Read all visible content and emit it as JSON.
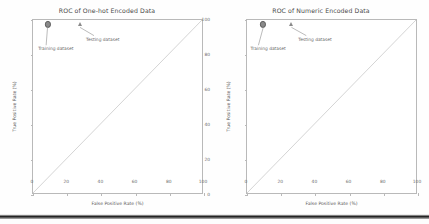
{
  "figure": {
    "background": "#ffffff",
    "axis_color": "#b9b9b9",
    "diagonal_color": "#c9c9c9",
    "marker_color": "#8a8a8a",
    "text_color": "#6d6d6d"
  },
  "chart_data": [
    {
      "type": "scatter",
      "title": "ROC of One-hot Encoded Data",
      "xlabel": "False Positive Rate (%)",
      "ylabel": "True Positive Rate (%)",
      "xlim": [
        0,
        100
      ],
      "ylim": [
        0,
        100
      ],
      "xticks": [
        0,
        20,
        40,
        60,
        80,
        100
      ],
      "yticks": [
        0,
        20,
        40,
        60,
        80,
        100
      ],
      "xticklabels": [
        "0",
        "20",
        "40",
        "60",
        "80",
        "100"
      ],
      "yticklabels": [
        "0",
        "20",
        "40",
        "60",
        "80",
        "100"
      ],
      "grid": false,
      "legend": "none",
      "reference_line": {
        "name": "chance-diagonal",
        "from": [
          0,
          0
        ],
        "to": [
          100,
          100
        ]
      },
      "series": [
        {
          "name": "Training dataset",
          "marker": "circle",
          "points": [
            {
              "x": 8.5,
              "y": 97.5
            }
          ]
        },
        {
          "name": "Testing dataset",
          "marker": "triangle",
          "points": [
            {
              "x": 27.5,
              "y": 97.5
            }
          ]
        }
      ],
      "annotations": [
        {
          "text": "Training dataset",
          "target": [
            8.5,
            97.5
          ],
          "label_at": [
            3.0,
            85.0
          ]
        },
        {
          "text": "Testing dataset",
          "target": [
            27.5,
            97.5
          ],
          "label_at": [
            31.0,
            90.5
          ]
        }
      ]
    },
    {
      "type": "scatter",
      "title": "ROC of Numeric Encoded Data",
      "xlabel": "False Positive Rate (%)",
      "ylabel": "True Positive Rate (%)",
      "xlim": [
        0,
        100
      ],
      "ylim": [
        0,
        100
      ],
      "xticks": [
        0,
        20,
        40,
        60,
        80,
        100
      ],
      "yticks": [
        0,
        20,
        40,
        60,
        80,
        100
      ],
      "xticklabels": [
        "0",
        "20",
        "40",
        "60",
        "80",
        "100"
      ],
      "yticklabels": [
        "0",
        "20",
        "40",
        "60",
        "80",
        "100"
      ],
      "grid": false,
      "legend": "none",
      "reference_line": {
        "name": "chance-diagonal",
        "from": [
          0,
          0
        ],
        "to": [
          100,
          100
        ]
      },
      "series": [
        {
          "name": "Training dataset",
          "marker": "circle",
          "points": [
            {
              "x": 9.5,
              "y": 97.5
            }
          ]
        },
        {
          "name": "Testing dataset",
          "marker": "triangle",
          "points": [
            {
              "x": 26.0,
              "y": 97.5
            }
          ]
        }
      ],
      "annotations": [
        {
          "text": "Training dataset",
          "target": [
            9.5,
            97.5
          ],
          "label_at": [
            2.0,
            85.0
          ]
        },
        {
          "text": "Testing dataset",
          "target": [
            26.0,
            97.5
          ],
          "label_at": [
            30.0,
            90.5
          ]
        }
      ]
    }
  ]
}
